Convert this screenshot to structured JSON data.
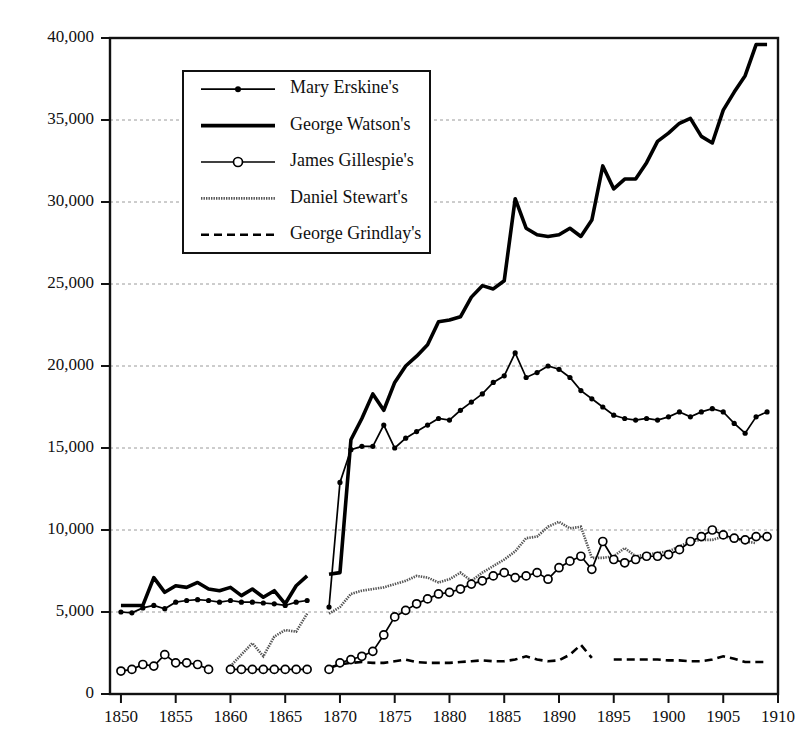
{
  "chart_data": {
    "type": "line",
    "title": "",
    "xlabel": "",
    "ylabel": "",
    "xlim": [
      1849,
      1910
    ],
    "ylim": [
      0,
      40000
    ],
    "grid": true,
    "legend_position": "upper-left-inside",
    "y_ticks": [
      0,
      5000,
      10000,
      15000,
      20000,
      25000,
      30000,
      35000,
      40000
    ],
    "y_tick_labels": [
      "0",
      "5,000",
      "10,000",
      "15,000",
      "20,000",
      "25,000",
      "30,000",
      "35,000",
      "40,000"
    ],
    "x_ticks": [
      1850,
      1855,
      1860,
      1865,
      1870,
      1875,
      1880,
      1885,
      1890,
      1895,
      1900,
      1905,
      1910
    ],
    "x_tick_labels": [
      "1850",
      "1855",
      "1860",
      "1865",
      "1870",
      "1875",
      "1880",
      "1885",
      "1890",
      "1895",
      "1900",
      "1905",
      "1910"
    ],
    "series": [
      {
        "name": "Mary Erskine's",
        "style": "solid-dot",
        "marker": "filled-circle",
        "color": "#000000",
        "segments": [
          {
            "x": [
              1850,
              1851,
              1852,
              1853,
              1854,
              1855,
              1856,
              1857,
              1858,
              1859,
              1860,
              1861,
              1862,
              1863,
              1864,
              1865,
              1866,
              1867
            ],
            "y": [
              5000,
              4950,
              5250,
              5400,
              5200,
              5600,
              5700,
              5750,
              5700,
              5600,
              5700,
              5600,
              5600,
              5550,
              5500,
              5400,
              5600,
              5700
            ]
          },
          {
            "x": [
              1869,
              1870,
              1871,
              1872,
              1873,
              1874,
              1875,
              1876,
              1877,
              1878,
              1879,
              1880,
              1881,
              1882,
              1883,
              1884,
              1885,
              1886,
              1887,
              1888,
              1889,
              1890,
              1891,
              1892,
              1893,
              1894,
              1895,
              1896,
              1897,
              1898,
              1899,
              1900,
              1901,
              1902,
              1903,
              1904,
              1905,
              1906,
              1907,
              1908,
              1909
            ],
            "y": [
              5300,
              12900,
              14900,
              15100,
              15100,
              16400,
              15000,
              15600,
              16000,
              16400,
              16800,
              16700,
              17300,
              17800,
              18300,
              19000,
              19400,
              20800,
              19300,
              19600,
              20000,
              19800,
              19300,
              18500,
              18000,
              17500,
              17000,
              16800,
              16700,
              16800,
              16700,
              16900,
              17200,
              16900,
              17200,
              17400,
              17200,
              16500,
              15900,
              16900,
              17200
            ]
          }
        ]
      },
      {
        "name": "George Watson's",
        "style": "thick-solid",
        "marker": "none",
        "color": "#000000",
        "segments": [
          {
            "x": [
              1850,
              1851,
              1852,
              1853,
              1854,
              1855,
              1856,
              1857,
              1858,
              1859,
              1860,
              1861,
              1862,
              1863,
              1864,
              1865,
              1866,
              1867
            ],
            "y": [
              5400,
              5400,
              5400,
              7100,
              6200,
              6600,
              6500,
              6800,
              6400,
              6300,
              6500,
              6000,
              6400,
              5900,
              6300,
              5500,
              6600,
              7200
            ]
          },
          {
            "x": [
              1869,
              1870,
              1871,
              1872,
              1873,
              1874,
              1875,
              1876,
              1877,
              1878,
              1879,
              1880,
              1881,
              1882,
              1883,
              1884,
              1885,
              1886,
              1887,
              1888,
              1889,
              1890,
              1891,
              1892,
              1893,
              1894,
              1895,
              1896,
              1897,
              1898,
              1899,
              1900,
              1901,
              1902,
              1903,
              1904,
              1905,
              1906,
              1907,
              1908,
              1909
            ],
            "y": [
              7300,
              7400,
              15500,
              16800,
              18300,
              17300,
              19000,
              20000,
              20600,
              21300,
              22700,
              22800,
              23000,
              24200,
              24900,
              24700,
              25200,
              30200,
              28400,
              28000,
              27900,
              28000,
              28400,
              27900,
              28900,
              32200,
              30800,
              31400,
              31400,
              32400,
              33700,
              34200,
              34800,
              35100,
              34000,
              33600,
              35600,
              36700,
              37700,
              39600,
              39600
            ]
          }
        ]
      },
      {
        "name": "James Gillespie's",
        "style": "solid-ring",
        "marker": "open-circle",
        "color": "#000000",
        "segments": [
          {
            "x": [
              1850,
              1851,
              1852,
              1853,
              1854,
              1855,
              1856,
              1857,
              1858
            ],
            "y": [
              1400,
              1500,
              1800,
              1700,
              2400,
              1900,
              1900,
              1800,
              1500
            ]
          },
          {
            "x": [
              1860,
              1861,
              1862,
              1863,
              1864,
              1865,
              1866,
              1867
            ],
            "y": [
              1500,
              1500,
              1500,
              1500,
              1500,
              1500,
              1500,
              1500
            ]
          },
          {
            "x": [
              1869,
              1870,
              1871,
              1872,
              1873,
              1874,
              1875,
              1876,
              1877,
              1878,
              1879,
              1880,
              1881,
              1882,
              1883,
              1884,
              1885,
              1886,
              1887,
              1888,
              1889,
              1890,
              1891,
              1892,
              1893,
              1894,
              1895,
              1896,
              1897,
              1898,
              1899,
              1900,
              1901,
              1902,
              1903,
              1904,
              1905,
              1906,
              1907,
              1908,
              1909
            ],
            "y": [
              1500,
              1900,
              2100,
              2300,
              2600,
              3600,
              4700,
              5100,
              5500,
              5800,
              6100,
              6200,
              6400,
              6700,
              6900,
              7200,
              7400,
              7100,
              7200,
              7400,
              7000,
              7700,
              8100,
              8400,
              7600,
              9300,
              8200,
              8000,
              8200,
              8400,
              8400,
              8500,
              8800,
              9300,
              9600,
              10000,
              9700,
              9500,
              9400,
              9600,
              9600
            ]
          }
        ]
      },
      {
        "name": "Daniel Stewart's",
        "style": "hatched",
        "marker": "none",
        "color": "#555555",
        "segments": [
          {
            "x": [
              1860,
              1861,
              1862,
              1863,
              1864,
              1865,
              1866,
              1867
            ],
            "y": [
              1700,
              2400,
              3100,
              2300,
              3500,
              3900,
              3800,
              4900
            ]
          },
          {
            "x": [
              1869,
              1870,
              1871,
              1872,
              1873,
              1874,
              1875,
              1876,
              1877,
              1878,
              1879,
              1880,
              1881,
              1882,
              1883,
              1884,
              1885,
              1886,
              1887,
              1888,
              1889,
              1890,
              1891,
              1892,
              1893,
              1894,
              1895,
              1896,
              1897,
              1898,
              1899,
              1900,
              1901,
              1902,
              1903,
              1904,
              1905,
              1906,
              1907,
              1908
            ],
            "y": [
              4900,
              5300,
              6100,
              6300,
              6400,
              6500,
              6700,
              6900,
              7200,
              7100,
              6800,
              7000,
              7400,
              6900,
              7400,
              7800,
              8200,
              8700,
              9500,
              9600,
              10200,
              10500,
              10100,
              10200,
              8300,
              8300,
              8400,
              8900,
              8400,
              8500,
              8600,
              8700,
              9000,
              9300,
              9400,
              9400,
              9600,
              9500,
              9300,
              9200
            ]
          }
        ]
      },
      {
        "name": "George Grindlay's",
        "style": "dashed",
        "marker": "none",
        "color": "#000000",
        "segments": [
          {
            "x": [
              1869,
              1870,
              1871,
              1872,
              1873,
              1874,
              1875,
              1876,
              1877,
              1878,
              1879,
              1880,
              1881,
              1882,
              1883,
              1884,
              1885,
              1886,
              1887,
              1888,
              1889,
              1890,
              1891,
              1892,
              1893
            ],
            "y": [
              1600,
              1800,
              1900,
              1950,
              1900,
              1900,
              2000,
              2100,
              1950,
              1900,
              1900,
              1900,
              1950,
              2000,
              2050,
              2000,
              2000,
              2100,
              2300,
              2100,
              2000,
              2050,
              2400,
              3000,
              2200
            ]
          },
          {
            "x": [
              1895,
              1896,
              1897,
              1898,
              1899,
              1900,
              1901,
              1902,
              1903,
              1904,
              1905,
              1906,
              1907,
              1908,
              1909
            ],
            "y": [
              2100,
              2100,
              2100,
              2100,
              2100,
              2050,
              2050,
              2000,
              2000,
              2100,
              2300,
              2150,
              1950,
              1950,
              1950
            ]
          }
        ]
      }
    ]
  },
  "legend": {
    "items": [
      {
        "label": "Mary Erskine's",
        "swatch": "line-dot-marker"
      },
      {
        "label": "George Watson's",
        "swatch": "thick-line"
      },
      {
        "label": "James Gillespie's",
        "swatch": "line-ring-marker"
      },
      {
        "label": "Daniel Stewart's",
        "swatch": "hatched-line"
      },
      {
        "label": "George Grindlay's",
        "swatch": "dashed-line"
      }
    ]
  }
}
